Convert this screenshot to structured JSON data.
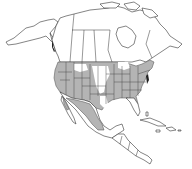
{
  "map": {
    "type": "species-range-map",
    "region": "North America",
    "colors": {
      "background": "#ffffff",
      "land": "#ffffff",
      "range_fill": "#b4b4b4",
      "outline": "#333333",
      "state_borders": "#444444"
    },
    "legend": [],
    "labels": [],
    "range_description": "Shaded distribution covering most of the contiguous United States (west, south, and east; patchy in northern Great Plains) and much of northern and central Mexico"
  }
}
